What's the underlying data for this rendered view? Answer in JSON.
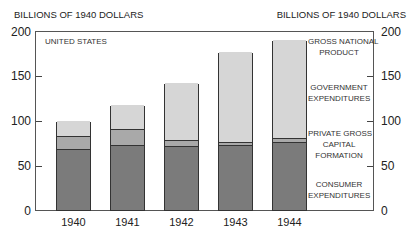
{
  "chart_data": {
    "type": "bar",
    "stacked": true,
    "title": "",
    "subtitle": "UNITED STATES",
    "ylabel_left": "BILLIONS OF 1940 DOLLARS",
    "ylabel_right": "BILLIONS OF 1940 DOLLARS",
    "xlabel": "",
    "ylim": [
      0,
      200
    ],
    "yticks": [
      0,
      50,
      100,
      150,
      200
    ],
    "grid": false,
    "legend_position": "right (inline labels)",
    "categories": [
      "1940",
      "1941",
      "1942",
      "1943",
      "1944"
    ],
    "series": [
      {
        "name": "CONSUMER EXPENDITURES",
        "values": [
          68,
          73,
          72,
          73,
          76
        ],
        "color": "#7b7b7b"
      },
      {
        "name": "PRIVATE GROSS CAPITAL FORMATION",
        "values": [
          15,
          17,
          6,
          3,
          4
        ],
        "color": "#a9a9a9"
      },
      {
        "name": "GOVERNMENT EXPENDITURES",
        "values": [
          16,
          27,
          64,
          101,
          110
        ],
        "color": "#d6d6d6"
      }
    ],
    "totals": {
      "name": "GROSS NATIONAL PRODUCT",
      "values": [
        99,
        117,
        142,
        177,
        190
      ]
    },
    "annotations": [
      "UNITED STATES",
      "GROSS NATIONAL PRODUCT",
      "GOVERNMENT EXPENDITURES",
      "PRIVATE GROSS CAPITAL FORMATION",
      "CONSUMER EXPENDITURES"
    ]
  },
  "labels": {
    "ylabel_left": "BILLIONS OF 1940 DOLLARS",
    "ylabel_right": "BILLIONS OF 1940 DOLLARS",
    "country": "UNITED STATES",
    "gnp_line1": "GROSS NATIONAL",
    "gnp_line2": "PRODUCT",
    "gov_line1": "GOVERNMENT",
    "gov_line2": "EXPENDITURES",
    "pgcf_line1": "PRIVATE GROSS",
    "pgcf_line2": "CAPITAL",
    "pgcf_line3": "FORMATION",
    "cons_line1": "CONSUMER",
    "cons_line2": "EXPENDITURES"
  },
  "ticks": [
    "0",
    "50",
    "100",
    "150",
    "200"
  ]
}
